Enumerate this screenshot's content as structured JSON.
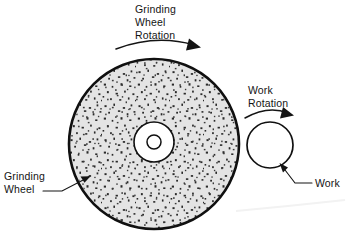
{
  "figure": {
    "background_color": "#ffffff",
    "ink_color": "#141414"
  },
  "labels": {
    "wheel_rotation": {
      "lines": [
        "Grinding",
        "Wheel",
        "Rotation"
      ],
      "line1": "Grinding",
      "line2": "Wheel",
      "line3": "Rotation"
    },
    "work_rotation": {
      "lines": [
        "Work",
        "Rotation"
      ],
      "line1": "Work",
      "line2": "Rotation"
    },
    "grinding_wheel": {
      "lines": [
        "Grinding",
        "Wheel"
      ],
      "line1": "Grinding",
      "line2": "Wheel"
    },
    "work": {
      "line1": "Work"
    }
  },
  "shapes": {
    "grinding_wheel": {
      "name": "grinding-wheel",
      "cx": 154,
      "cy": 144,
      "r": 85,
      "fill": "#e3e3e3",
      "stroke": "#101010",
      "texture": "abrasive-grit-speckle"
    },
    "hub_ring": {
      "name": "wheel-hub-ring",
      "cx": 154,
      "cy": 142,
      "r": 20,
      "fill": "#ffffff"
    },
    "hub_bore": {
      "name": "wheel-bore",
      "cx": 154,
      "cy": 142,
      "r": 7,
      "fill": "#ffffff"
    },
    "workpiece": {
      "name": "workpiece",
      "cx": 270,
      "cy": 145,
      "r": 23,
      "fill": "#ffffff",
      "stroke": "#101010"
    }
  },
  "arrows": {
    "wheel_rotation_arc": {
      "name": "wheel-rotation-arrow",
      "direction": "clockwise"
    },
    "work_rotation_arc": {
      "name": "work-rotation-arrow",
      "direction": "clockwise"
    },
    "grinding_wheel_leader": {
      "name": "grinding-wheel-leader",
      "points_to": "wheel-rim-lower-left"
    },
    "work_leader": {
      "name": "work-leader",
      "points_to": "workpiece-lower-right"
    }
  }
}
